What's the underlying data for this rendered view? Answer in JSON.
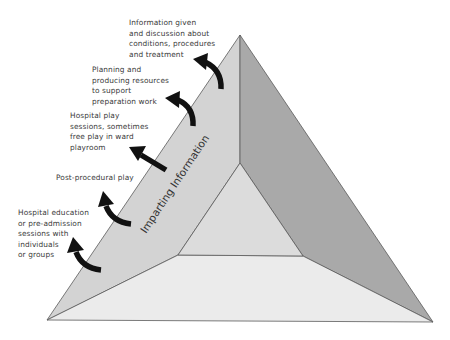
{
  "diagram": {
    "axis_label": "Imparting Information",
    "colors": {
      "left_face": "#d3d3d3",
      "right_face": "#a9a9a9",
      "bottom_face": "#ebebeb",
      "inner_triangle": "#dcdcdc",
      "edge": "#5a5a5a",
      "arrow": "#111111",
      "text": "#3a3a3a"
    },
    "labels": [
      {
        "id": "info-given",
        "text": "Information given\nand discussion about\nconditions, procedures\nand treatment"
      },
      {
        "id": "planning",
        "text": "Planning and\nproducing resources\nto support\npreparation work"
      },
      {
        "id": "hospital-play",
        "text": "Hospital play\nsessions, sometimes\nfree play in ward\nplayroom"
      },
      {
        "id": "post-procedural",
        "text": "Post-procedural play"
      },
      {
        "id": "hospital-education",
        "text": "Hospital education\nor pre-admission\nsessions with\nindividuals\nor groups"
      }
    ]
  }
}
